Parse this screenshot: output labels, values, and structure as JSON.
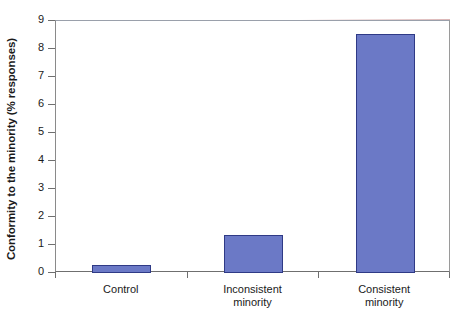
{
  "chart_data": {
    "type": "bar",
    "title": "",
    "xlabel": "",
    "ylabel": "Conformity to the minority (% responses)",
    "categories": [
      "Control",
      "Inconsistent minority",
      "Consistent minority"
    ],
    "category_lines": [
      [
        "Control"
      ],
      [
        "Inconsistent",
        "minority"
      ],
      [
        "Consistent",
        "minority"
      ]
    ],
    "values": [
      0.28,
      1.35,
      8.55
    ],
    "ylim": [
      0,
      9
    ],
    "ytick_labels": [
      "0",
      "1",
      "2",
      "3",
      "4",
      "5",
      "6",
      "7",
      "8",
      "9"
    ],
    "ytick_values": [
      0,
      1,
      2,
      3,
      4,
      5,
      6,
      7,
      8,
      9
    ],
    "grid": false,
    "legend": "none",
    "bar_color": "#6b79c6",
    "bar_border_color": "#2f3a86",
    "axis_color": "#6f6f6f",
    "background": "#ffffff"
  }
}
